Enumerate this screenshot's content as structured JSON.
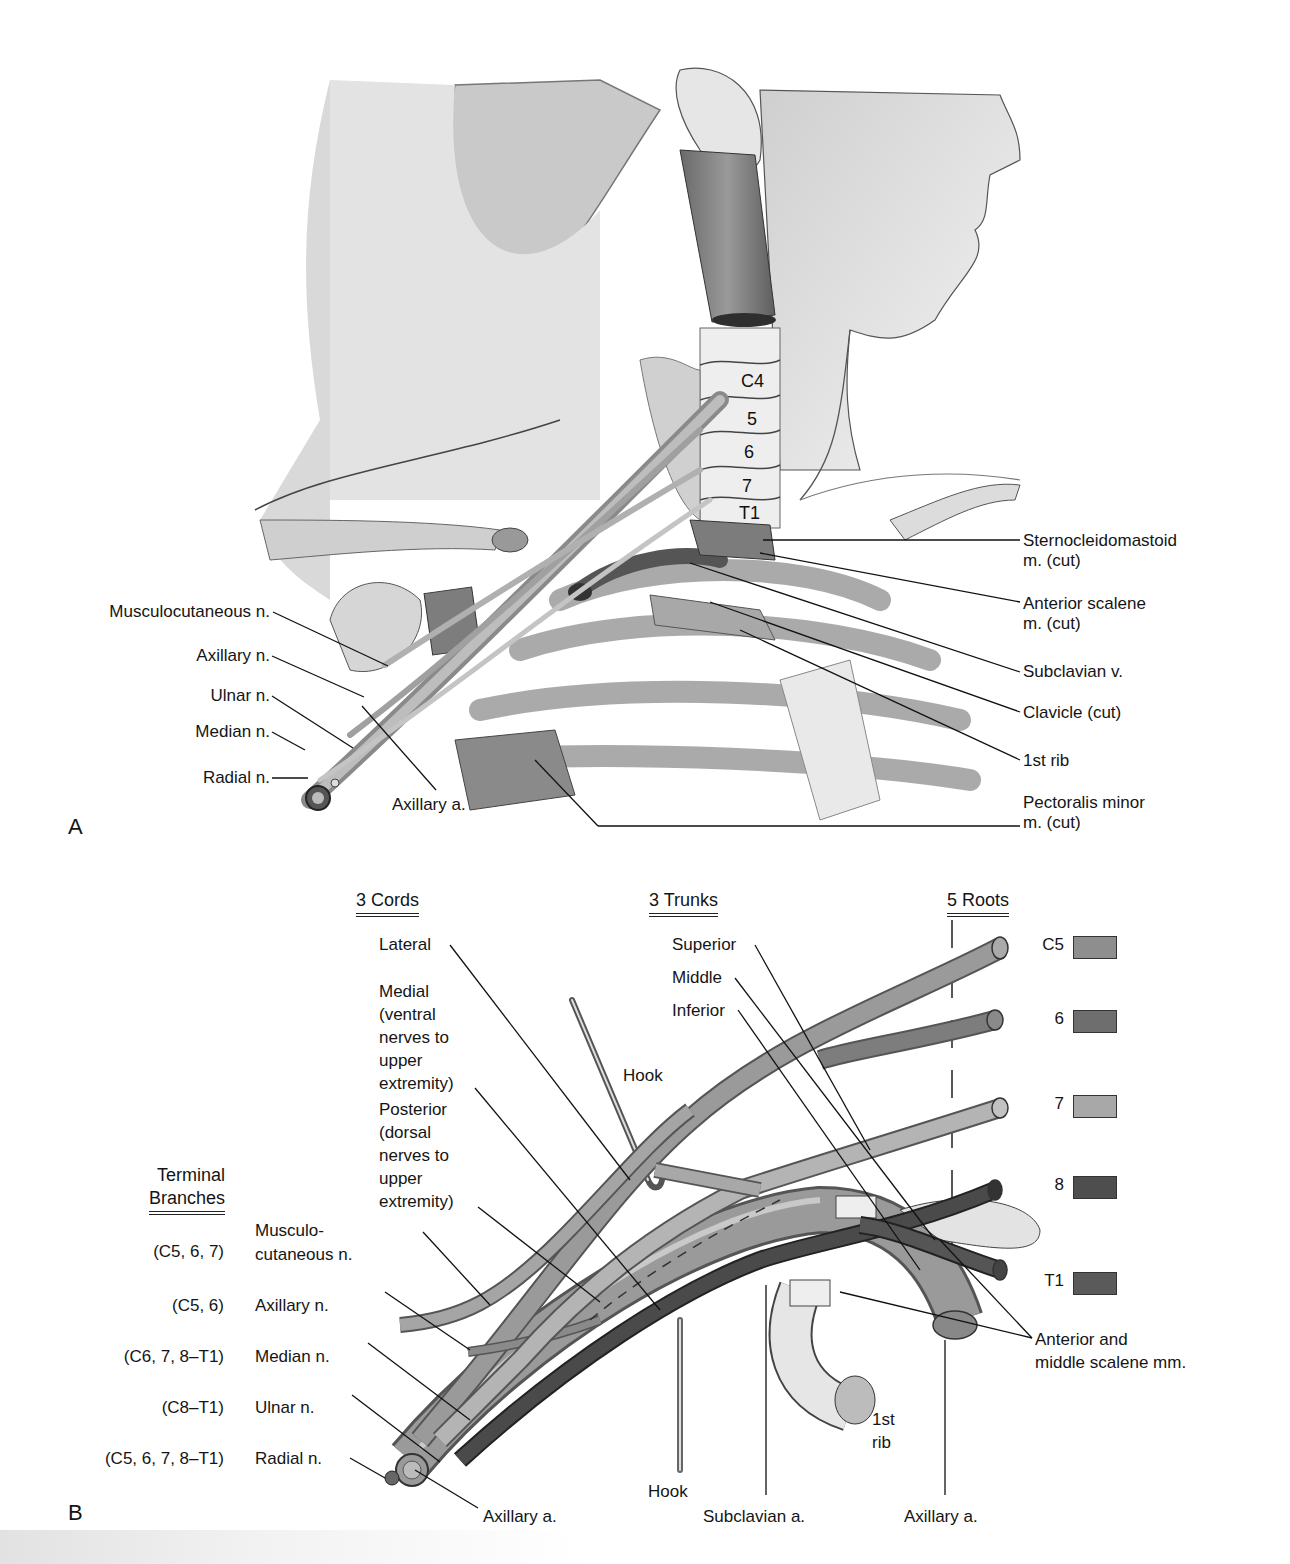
{
  "panel_a": {
    "letter": "A",
    "vertebrae": [
      "C4",
      "5",
      "6",
      "7",
      "T1"
    ],
    "left_labels": [
      "Musculocutaneous n.",
      "Axillary n.",
      "Ulnar n.",
      "Median n.",
      "Radial n."
    ],
    "bottom_label": "Axillary a.",
    "right_labels": [
      "Sternocleidomastoid\nm. (cut)",
      "Anterior scalene\nm. (cut)",
      "Subclavian v.",
      "Clavicle (cut)",
      "1st rib",
      "Pectoralis minor\nm. (cut)"
    ]
  },
  "panel_b": {
    "letter": "B",
    "headers": {
      "cords": "3  Cords",
      "trunks": "3  Trunks",
      "roots": "5 Roots",
      "terminal": "Terminal",
      "branches": "Branches"
    },
    "cords": [
      "Lateral",
      "Medial\n(ventral\nnerves to\nupper\nextremity)",
      "Posterior\n(dorsal\nnerves to\nupper\nextremity)"
    ],
    "trunks": [
      "Superior",
      "Middle",
      "Inferior"
    ],
    "roots": [
      {
        "label": "C5",
        "color": "#8e8e8e"
      },
      {
        "label": "6",
        "color": "#6e6e6e"
      },
      {
        "label": "7",
        "color": "#a8a8a8"
      },
      {
        "label": "8",
        "color": "#4e4e4e"
      },
      {
        "label": "T1",
        "color": "#5a5a5a"
      }
    ],
    "terminal_branches": [
      {
        "roots": "(C5, 6, 7)",
        "name": "Musculo-\ncutaneous n."
      },
      {
        "roots": "(C5, 6)",
        "name": "Axillary n."
      },
      {
        "roots": "(C6, 7, 8–T1)",
        "name": "Median n."
      },
      {
        "roots": "(C8–T1)",
        "name": "Ulnar n."
      },
      {
        "roots": "(C5, 6, 7, 8–T1)",
        "name": "Radial n."
      }
    ],
    "hook_top": "Hook",
    "hook_bottom": "Hook",
    "scalene": "Anterior and\nmiddle scalene mm.",
    "rib": "1st\nrib",
    "bottom_labels": [
      "Axillary a.",
      "Subclavian a.",
      "Axillary a."
    ]
  }
}
